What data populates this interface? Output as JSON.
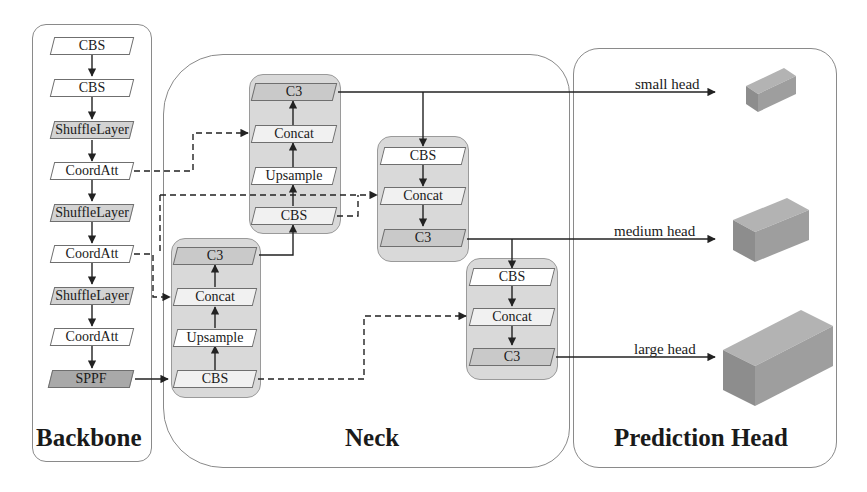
{
  "panels": {
    "backbone": {
      "title": "Backbone"
    },
    "neck": {
      "title": "Neck"
    },
    "head": {
      "title": "Prediction Head"
    }
  },
  "backbone": {
    "blocks": [
      "CBS",
      "CBS",
      "ShuffleLayer",
      "CoordAtt",
      "ShuffleLayer",
      "CoordAtt",
      "ShuffleLayer",
      "CoordAtt",
      "SPPF"
    ]
  },
  "neck": {
    "top_up": [
      "C3",
      "Concat",
      "Upsample",
      "CBS"
    ],
    "bottom_up": [
      "C3",
      "Concat",
      "Upsample",
      "CBS"
    ],
    "down_mid": [
      "CBS",
      "Concat",
      "C3"
    ],
    "down_low": [
      "CBS",
      "Concat",
      "C3"
    ]
  },
  "heads": [
    {
      "label": "small head"
    },
    {
      "label": "medium head"
    },
    {
      "label": "large head"
    }
  ],
  "colors": {
    "block_white": "#ffffff",
    "block_gray": "#d3d3d3",
    "block_dark": "#a9a9a9",
    "group_fill": "#d9d9d9",
    "cube_fill": "#9e9e9e",
    "line": "#222222"
  }
}
